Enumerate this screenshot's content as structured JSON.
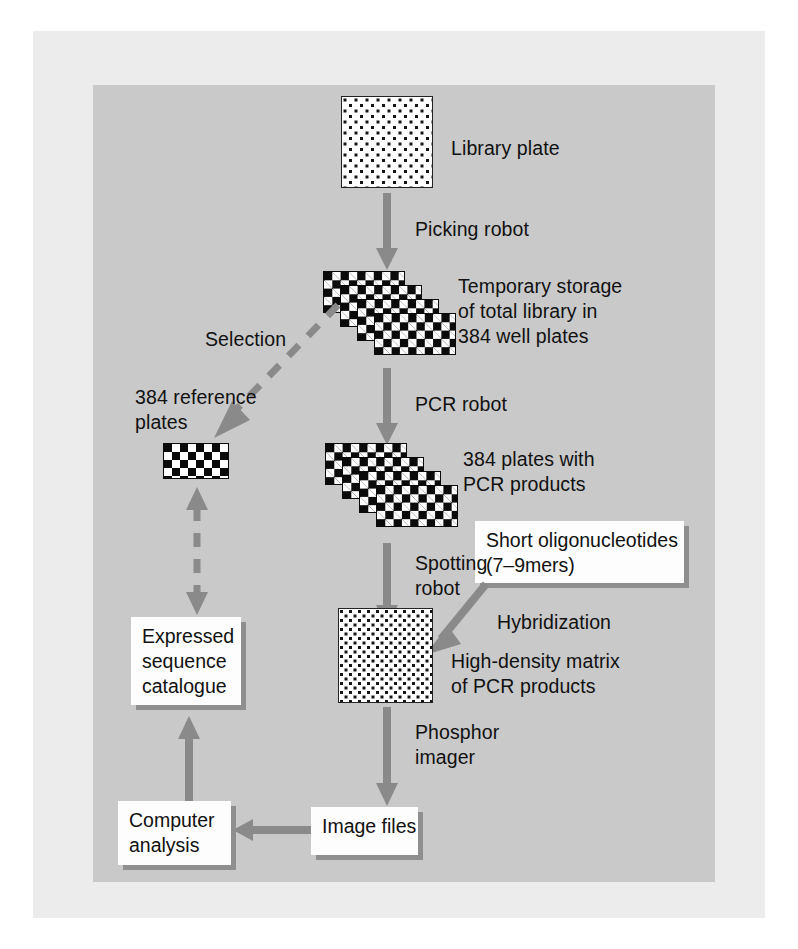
{
  "figure": {
    "background_page": "#ffffff",
    "background_paper": "#ececec",
    "background_panel": "#c9c9c9",
    "arrow_color": "#8a8a8a",
    "text_color": "#111111",
    "box_fill": "#fdfdfd",
    "box_shadow": "#8f8f8f"
  },
  "nodes": {
    "library_plate_label": "Library plate",
    "temporary_storage_label": "Temporary storage\nof total library in\n384 well plates",
    "reference_plates_label": "384 reference\nplates",
    "pcr_plates_label": "384 plates with\nPCR products",
    "oligos_box": "Short oligonucleotides\n(7–9mers)",
    "matrix_label": "High-density matrix\nof PCR products",
    "expressed_box": "Expressed\nsequence\ncatalogue",
    "computer_box": "Computer\nanalysis",
    "image_files_box": "Image files"
  },
  "edges": {
    "picking_robot": "Picking robot",
    "selection": "Selection",
    "pcr_robot": "PCR robot",
    "spotting_robot": "Spotting\nrobot",
    "hybridization": "Hybridization",
    "phosphor_imager": "Phosphor\nimager"
  },
  "icons": {
    "library_plate": "dotted-plate-icon",
    "well_plate_stack": "checkerboard-plate-stack-icon",
    "reference_plate": "checkerboard-plate-icon",
    "pcr_plate_stack": "checkerboard-plate-stack-icon",
    "high_density_matrix": "dotted-matrix-icon"
  }
}
